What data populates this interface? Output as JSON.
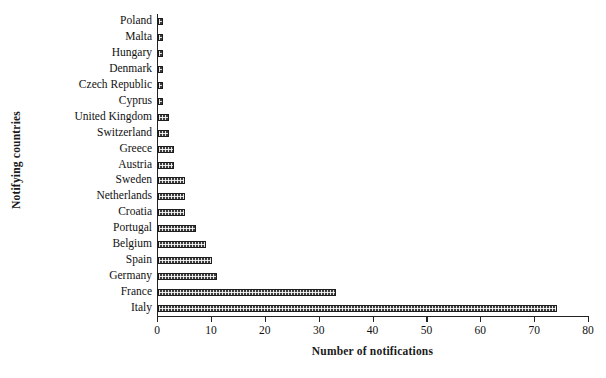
{
  "chart_data": {
    "type": "bar",
    "orientation": "horizontal",
    "title": "",
    "xlabel": "Number of notifications",
    "ylabel": "Notifying countries",
    "xlim": [
      0,
      80
    ],
    "xticks": [
      0,
      10,
      20,
      30,
      40,
      50,
      60,
      70,
      80
    ],
    "grid": false,
    "legend": false,
    "bar_fill_color": "#3d3d3d",
    "bar_edge_color": "#1d1d1d",
    "bar_pattern": "dotted-checkered",
    "axis_color": "#222222",
    "background_color": "#ffffff",
    "categories": [
      "Poland",
      "Malta",
      "Hungary",
      "Denmark",
      "Czech Republic",
      "Cyprus",
      "United Kingdom",
      "Switzerland",
      "Greece",
      "Austria",
      "Sweden",
      "Netherlands",
      "Croatia",
      "Portugal",
      "Belgium",
      "Spain",
      "Germany",
      "France",
      "Italy"
    ],
    "values": [
      1,
      1,
      1,
      1,
      1,
      1,
      2,
      2,
      3,
      3,
      5,
      5,
      5,
      7,
      9,
      10,
      11,
      33,
      74
    ]
  }
}
